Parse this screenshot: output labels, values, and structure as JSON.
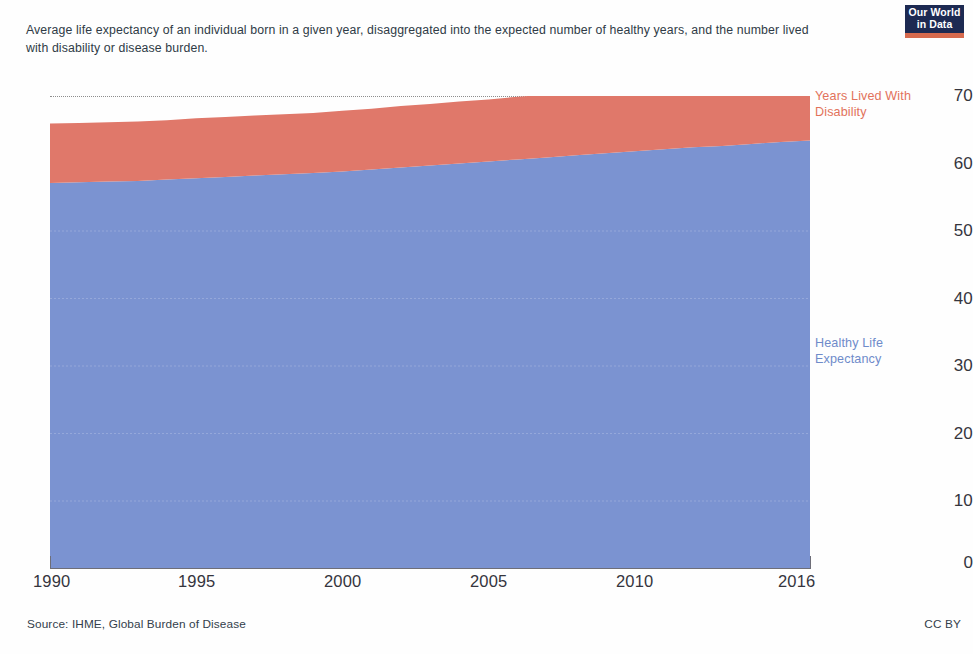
{
  "subtitle": "Average life expectancy of an individual born in a given year, disaggregated into the expected number of healthy years, and the number lived with disability or disease burden.",
  "logo": {
    "line1": "Our World",
    "line2": "in Data",
    "box_color": "#1d2a52",
    "bar_color": "#d66a4e"
  },
  "footer": {
    "source": "Source: IHME, Global Burden of Disease",
    "license": "CC BY"
  },
  "legend": {
    "yld": "Years Lived With\nDisability",
    "hale": "Healthy Life\nExpectancy"
  },
  "axis": {
    "y_ticks": [
      "0",
      "10",
      "20",
      "30",
      "40",
      "50",
      "60",
      "70"
    ],
    "x_ticks": [
      "1990",
      "1995",
      "2000",
      "2005",
      "2010",
      "2016"
    ]
  },
  "chart_data": {
    "type": "area",
    "stacked": true,
    "title": "",
    "subtitle": "Average life expectancy of an individual born in a given year, disaggregated into the expected number of healthy years, and the number lived with disability or disease burden.",
    "xlabel": "",
    "ylabel": "",
    "xlim": [
      1990,
      2016
    ],
    "ylim": [
      0,
      70
    ],
    "y_ticks": [
      0,
      10,
      20,
      30,
      40,
      50,
      60,
      70
    ],
    "x_ticks": [
      1990,
      1995,
      2000,
      2005,
      2010,
      2016
    ],
    "grid": "horizontal-dotted-at-70-only",
    "legend_position": "right-inline",
    "colors": {
      "healthy_life_expectancy": "#7b93d1",
      "years_lived_with_disability": "#e0786a"
    },
    "x": [
      1990,
      1991,
      1992,
      1993,
      1994,
      1995,
      1996,
      1997,
      1998,
      1999,
      2000,
      2001,
      2002,
      2003,
      2004,
      2005,
      2006,
      2007,
      2008,
      2009,
      2010,
      2011,
      2012,
      2013,
      2014,
      2015,
      2016
    ],
    "series": [
      {
        "name": "Healthy Life Expectancy",
        "color": "#7b93d1",
        "values": [
          57.1,
          57.2,
          57.3,
          57.4,
          57.6,
          57.8,
          58.0,
          58.2,
          58.4,
          58.6,
          58.8,
          59.1,
          59.4,
          59.7,
          60.0,
          60.3,
          60.6,
          60.9,
          61.2,
          61.5,
          61.8,
          62.1,
          62.4,
          62.6,
          62.9,
          63.2,
          63.4
        ]
      },
      {
        "name": "Years Lived With Disability",
        "color": "#e0786a",
        "values": [
          8.8,
          8.8,
          8.8,
          8.8,
          8.8,
          8.9,
          8.9,
          8.9,
          8.9,
          8.9,
          9.0,
          9.0,
          9.1,
          9.1,
          9.2,
          9.2,
          9.3,
          9.3,
          9.4,
          9.4,
          9.5,
          9.6,
          9.6,
          9.7,
          9.8,
          9.8,
          9.9
        ]
      }
    ],
    "totals": [
      65.9,
      66.0,
      66.1,
      66.2,
      66.4,
      66.7,
      66.9,
      67.1,
      67.3,
      67.5,
      67.8,
      68.1,
      68.5,
      68.8,
      69.2,
      69.5,
      69.9,
      70.2,
      70.6,
      70.9,
      71.3,
      71.7,
      72.0,
      72.3,
      72.7,
      73.0,
      73.3
    ],
    "annotations": [
      {
        "text": "Years Lived With Disability",
        "target": "upper-band",
        "side": "right"
      },
      {
        "text": "Healthy Life Expectancy",
        "target": "lower-band",
        "side": "right"
      }
    ],
    "source": "IHME, Global Burden of Disease",
    "license": "CC BY"
  }
}
